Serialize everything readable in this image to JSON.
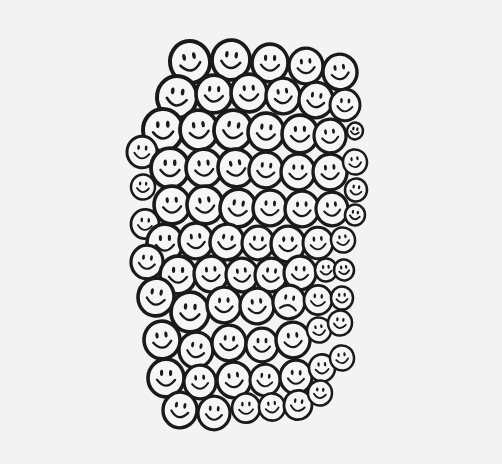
{
  "image": {
    "description": "Hand-drawn cluster of smiley faces with a single frowning face",
    "background": "#f3f3f3",
    "face_fill": "#f6f6f6",
    "ink": "#1a1a1a",
    "faces": [
      {
        "x": 190,
        "y": 62,
        "r": 20,
        "mood": "smile"
      },
      {
        "x": 231,
        "y": 60,
        "r": 19,
        "mood": "smile"
      },
      {
        "x": 270,
        "y": 63,
        "r": 18,
        "mood": "smile"
      },
      {
        "x": 306,
        "y": 66,
        "r": 17,
        "mood": "smile"
      },
      {
        "x": 340,
        "y": 72,
        "r": 17,
        "mood": "smile"
      },
      {
        "x": 177,
        "y": 97,
        "r": 20,
        "mood": "smile"
      },
      {
        "x": 214,
        "y": 94,
        "r": 18,
        "mood": "smile"
      },
      {
        "x": 249,
        "y": 93,
        "r": 18,
        "mood": "smile"
      },
      {
        "x": 283,
        "y": 96,
        "r": 17,
        "mood": "smile"
      },
      {
        "x": 316,
        "y": 100,
        "r": 17,
        "mood": "smile"
      },
      {
        "x": 345,
        "y": 105,
        "r": 15,
        "mood": "smile"
      },
      {
        "x": 163,
        "y": 130,
        "r": 20,
        "mood": "smile"
      },
      {
        "x": 199,
        "y": 130,
        "r": 19,
        "mood": "smile"
      },
      {
        "x": 233,
        "y": 130,
        "r": 19,
        "mood": "smile"
      },
      {
        "x": 266,
        "y": 132,
        "r": 18,
        "mood": "smile"
      },
      {
        "x": 300,
        "y": 134,
        "r": 18,
        "mood": "smile"
      },
      {
        "x": 330,
        "y": 136,
        "r": 16,
        "mood": "smile"
      },
      {
        "x": 355,
        "y": 131,
        "r": 8,
        "mood": "smile"
      },
      {
        "x": 142,
        "y": 152,
        "r": 15,
        "mood": "smile"
      },
      {
        "x": 170,
        "y": 168,
        "r": 19,
        "mood": "smile"
      },
      {
        "x": 204,
        "y": 168,
        "r": 18,
        "mood": "smile"
      },
      {
        "x": 236,
        "y": 168,
        "r": 18,
        "mood": "smile"
      },
      {
        "x": 266,
        "y": 170,
        "r": 17,
        "mood": "smile"
      },
      {
        "x": 298,
        "y": 172,
        "r": 17,
        "mood": "smile"
      },
      {
        "x": 330,
        "y": 172,
        "r": 17,
        "mood": "smile"
      },
      {
        "x": 355,
        "y": 162,
        "r": 12,
        "mood": "smile"
      },
      {
        "x": 356,
        "y": 190,
        "r": 11,
        "mood": "smile"
      },
      {
        "x": 143,
        "y": 187,
        "r": 12,
        "mood": "smile"
      },
      {
        "x": 172,
        "y": 205,
        "r": 18,
        "mood": "smile"
      },
      {
        "x": 205,
        "y": 205,
        "r": 18,
        "mood": "smile"
      },
      {
        "x": 238,
        "y": 208,
        "r": 18,
        "mood": "smile"
      },
      {
        "x": 270,
        "y": 208,
        "r": 17,
        "mood": "smile"
      },
      {
        "x": 302,
        "y": 209,
        "r": 17,
        "mood": "smile"
      },
      {
        "x": 332,
        "y": 209,
        "r": 16,
        "mood": "smile"
      },
      {
        "x": 355,
        "y": 215,
        "r": 10,
        "mood": "smile"
      },
      {
        "x": 145,
        "y": 224,
        "r": 14,
        "mood": "smile"
      },
      {
        "x": 165,
        "y": 243,
        "r": 18,
        "mood": "smile"
      },
      {
        "x": 196,
        "y": 241,
        "r": 17,
        "mood": "smile"
      },
      {
        "x": 227,
        "y": 242,
        "r": 17,
        "mood": "smile"
      },
      {
        "x": 258,
        "y": 243,
        "r": 16,
        "mood": "smile"
      },
      {
        "x": 288,
        "y": 244,
        "r": 17,
        "mood": "smile"
      },
      {
        "x": 318,
        "y": 243,
        "r": 15,
        "mood": "smile"
      },
      {
        "x": 343,
        "y": 240,
        "r": 12,
        "mood": "smile"
      },
      {
        "x": 147,
        "y": 262,
        "r": 16,
        "mood": "smile"
      },
      {
        "x": 178,
        "y": 275,
        "r": 18,
        "mood": "smile"
      },
      {
        "x": 211,
        "y": 274,
        "r": 17,
        "mood": "smile"
      },
      {
        "x": 242,
        "y": 275,
        "r": 16,
        "mood": "smile"
      },
      {
        "x": 271,
        "y": 275,
        "r": 16,
        "mood": "smile"
      },
      {
        "x": 300,
        "y": 273,
        "r": 16,
        "mood": "smile"
      },
      {
        "x": 326,
        "y": 270,
        "r": 11,
        "mood": "smile"
      },
      {
        "x": 344,
        "y": 270,
        "r": 10,
        "mood": "smile"
      },
      {
        "x": 156,
        "y": 297,
        "r": 18,
        "mood": "smile"
      },
      {
        "x": 190,
        "y": 312,
        "r": 19,
        "mood": "smile"
      },
      {
        "x": 224,
        "y": 305,
        "r": 17,
        "mood": "smile"
      },
      {
        "x": 257,
        "y": 306,
        "r": 17,
        "mood": "smile"
      },
      {
        "x": 289,
        "y": 302,
        "r": 16,
        "mood": "frown"
      },
      {
        "x": 318,
        "y": 300,
        "r": 14,
        "mood": "smile"
      },
      {
        "x": 342,
        "y": 298,
        "r": 11,
        "mood": "smile"
      },
      {
        "x": 162,
        "y": 340,
        "r": 18,
        "mood": "smile"
      },
      {
        "x": 196,
        "y": 350,
        "r": 17,
        "mood": "smile"
      },
      {
        "x": 229,
        "y": 343,
        "r": 17,
        "mood": "smile"
      },
      {
        "x": 262,
        "y": 345,
        "r": 16,
        "mood": "smile"
      },
      {
        "x": 293,
        "y": 340,
        "r": 17,
        "mood": "smile"
      },
      {
        "x": 319,
        "y": 330,
        "r": 12,
        "mood": "smile"
      },
      {
        "x": 340,
        "y": 323,
        "r": 12,
        "mood": "smile"
      },
      {
        "x": 166,
        "y": 378,
        "r": 18,
        "mood": "smile"
      },
      {
        "x": 200,
        "y": 382,
        "r": 16,
        "mood": "smile"
      },
      {
        "x": 234,
        "y": 380,
        "r": 17,
        "mood": "smile"
      },
      {
        "x": 265,
        "y": 380,
        "r": 15,
        "mood": "smile"
      },
      {
        "x": 296,
        "y": 377,
        "r": 16,
        "mood": "smile"
      },
      {
        "x": 322,
        "y": 368,
        "r": 13,
        "mood": "smile"
      },
      {
        "x": 342,
        "y": 358,
        "r": 12,
        "mood": "smile"
      },
      {
        "x": 180,
        "y": 410,
        "r": 17,
        "mood": "smile"
      },
      {
        "x": 214,
        "y": 413,
        "r": 16,
        "mood": "smile"
      },
      {
        "x": 246,
        "y": 408,
        "r": 14,
        "mood": "smile"
      },
      {
        "x": 272,
        "y": 407,
        "r": 13,
        "mood": "smile"
      },
      {
        "x": 298,
        "y": 405,
        "r": 14,
        "mood": "smile"
      },
      {
        "x": 320,
        "y": 393,
        "r": 12,
        "mood": "smile"
      }
    ]
  }
}
